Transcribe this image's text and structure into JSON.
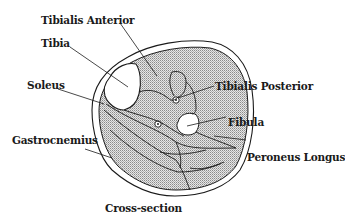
{
  "diagram": {
    "caption": "Cross-section",
    "colors": {
      "line": "#1a1a1a",
      "muscle_fill": "#cfcfcf",
      "bone_fill": "#ffffff",
      "background": "#ffffff"
    },
    "labels": {
      "tibialis_anterior": "Tibialis Anterior",
      "tibia": "Tibia",
      "soleus": "Soleus",
      "tibialis_posterior": "Tibialis Posterior",
      "fibula": "Fibula",
      "gastrocnemius": "Gastrocnemius",
      "peroneus_longus": "Peroneus Longus"
    }
  }
}
